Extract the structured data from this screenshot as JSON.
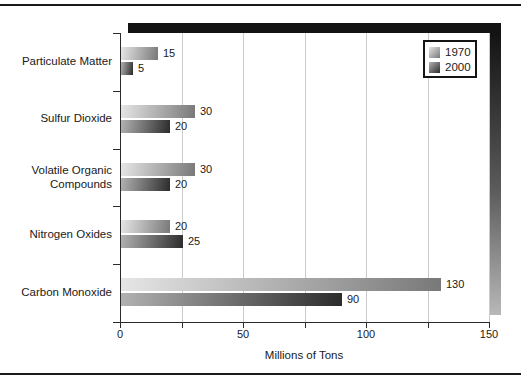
{
  "chart_data": {
    "type": "bar",
    "orientation": "horizontal",
    "title": "",
    "categories": [
      "Particulate Matter",
      "Sulfur Dioxide",
      "Volatile Organic Compounds",
      "Nitrogen Oxides",
      "Carbon Monoxide"
    ],
    "series": [
      {
        "name": "1970",
        "values": [
          15,
          30,
          30,
          20,
          130
        ],
        "gradient_start": "#e6e6e6",
        "gradient_end": "#787878"
      },
      {
        "name": "2000",
        "values": [
          5,
          20,
          20,
          25,
          90
        ],
        "gradient_start": "#b2b2b2",
        "gradient_end": "#2b2b2b"
      }
    ],
    "xlabel": "Millions of Tons",
    "ylabel": "",
    "xlim": [
      0,
      150
    ],
    "x_major_ticks": [
      0,
      50,
      100,
      150
    ],
    "x_major_tick_labels": [
      "0",
      "50",
      "100",
      "150"
    ],
    "x_minor_tick_step": 25,
    "grid": "vertical",
    "value_labels_shown": true,
    "legend": {
      "position": "top-right",
      "entries": [
        "1970",
        "2000"
      ]
    },
    "colors": {
      "axis": "#2b2b2b",
      "gridline": "#cbcbcb",
      "text": "#1a1a1a",
      "shadow_dark": "#131313",
      "shadow_light": "#b8b8b8",
      "background": "#ffffff"
    }
  }
}
